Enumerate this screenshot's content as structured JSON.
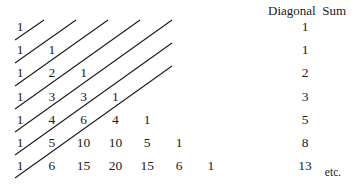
{
  "figure": {
    "width": 356,
    "height": 189,
    "background_color": "#ffffff",
    "ink_color": "#1b1b1b"
  },
  "header": {
    "diagonal_sum_label": "Diagonal  Sum"
  },
  "etc": {
    "label": "etc."
  },
  "chart_data": {
    "type": "table",
    "xlabel": "",
    "ylabel": "",
    "grid": false,
    "legend": "none",
    "columns": [
      "Pascal row entries",
      "Diagonal Sum"
    ],
    "rows": [
      {
        "index": 0,
        "entries": [
          "1"
        ],
        "sum": "1"
      },
      {
        "index": 1,
        "entries": [
          "1",
          "1"
        ],
        "sum": "1"
      },
      {
        "index": 2,
        "entries": [
          "1",
          "2",
          "1"
        ],
        "sum": "2"
      },
      {
        "index": 3,
        "entries": [
          "1",
          "3",
          "3",
          "1"
        ],
        "sum": "3"
      },
      {
        "index": 4,
        "entries": [
          "1",
          "4",
          "6",
          "4",
          "1"
        ],
        "sum": "5"
      },
      {
        "index": 5,
        "entries": [
          "1",
          "5",
          "10",
          "10",
          "5",
          "1"
        ],
        "sum": "8"
      },
      {
        "index": 6,
        "entries": [
          "1",
          "6",
          "15",
          "20",
          "15",
          "6",
          "1"
        ],
        "sum": "13"
      }
    ],
    "diagonal_sums": [
      1,
      1,
      2,
      3,
      5,
      8,
      13
    ],
    "sequence_name": "Fibonacci",
    "diagonal_line_count": 6
  },
  "layout": {
    "row_origin_y": 27,
    "row_step_y": 23.2,
    "col_origin_x": 20,
    "col_step_x": 31.8,
    "sum_column_x": 305,
    "diagonals": [
      {
        "x1": 15,
        "y1": 40,
        "x2": 44,
        "y2": 20
      },
      {
        "x1": 15,
        "y1": 63,
        "x2": 76,
        "y2": 20
      },
      {
        "x1": 15,
        "y1": 86,
        "x2": 108,
        "y2": 20
      },
      {
        "x1": 15,
        "y1": 109,
        "x2": 140,
        "y2": 20
      },
      {
        "x1": 15,
        "y1": 132,
        "x2": 172,
        "y2": 20
      },
      {
        "x1": 15,
        "y1": 155,
        "x2": 172,
        "y2": 43
      },
      {
        "x1": 15,
        "y1": 178,
        "x2": 172,
        "y2": 66
      }
    ]
  }
}
